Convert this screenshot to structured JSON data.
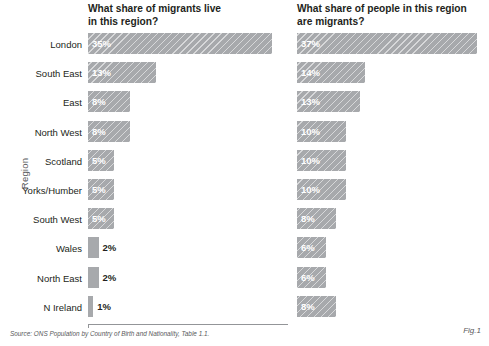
{
  "chart_data": {
    "type": "bar",
    "title": "",
    "xlabel": "",
    "ylabel": "Region",
    "grid": false,
    "legend": "none",
    "orientation": "horizontal",
    "categories": [
      "London",
      "South East",
      "East",
      "North West",
      "Scotland",
      "Yorks/Humber",
      "South West",
      "Wales",
      "North East",
      "N Ireland"
    ],
    "panels": [
      {
        "title": "What share of migrants live\nin this region?",
        "values": [
          35,
          13,
          8,
          8,
          5,
          5,
          5,
          2,
          2,
          1
        ],
        "labels": [
          "35%",
          "13%",
          "8%",
          "8%",
          "5%",
          "5%",
          "5%",
          "2%",
          "2%",
          "1%"
        ],
        "xlim": [
          0,
          38
        ]
      },
      {
        "title": "What share of people in this region\nare migrants?",
        "values": [
          37,
          14,
          13,
          10,
          10,
          10,
          8,
          6,
          6,
          8
        ],
        "labels": [
          "37%",
          "14%",
          "13%",
          "10%",
          "10%",
          "10%",
          "8%",
          "6%",
          "6%",
          "8%"
        ],
        "xlim": [
          0,
          38
        ]
      }
    ]
  },
  "axis": {
    "y_title": "Region"
  },
  "footer": {
    "source": "Source:  ONS Population by Country of Birth and Nationality, Table 1.1.",
    "fig": "Fig.1"
  }
}
